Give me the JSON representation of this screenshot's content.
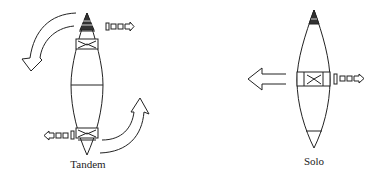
{
  "diagrams": [
    {
      "id": "tandem",
      "label": "Tandem",
      "description": "Tandem canoe with two paddlers: bow paddler on right side draw stroke, stern paddler on left side draw stroke; canoe pivots (curved arrows indicate rotation)"
    },
    {
      "id": "solo",
      "label": "Solo",
      "description": "Solo canoe with paddler at center; draw stroke on right side moves canoe sideways to the left (straight arrow)"
    }
  ],
  "colors": {
    "stroke": "#222222",
    "background": "#ffffff"
  },
  "icons": {
    "paddle_stroke": "paddle-with-arrow-icon",
    "rotation_arrow": "curved-arrow-icon",
    "translation_arrow": "straight-arrow-icon"
  }
}
